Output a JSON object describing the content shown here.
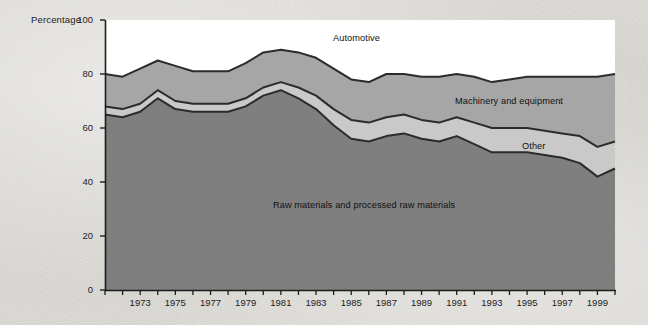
{
  "figure": {
    "background_color": "#d8d6d2",
    "plot_background": "#ffffff"
  },
  "axes": {
    "y_axis_title": "Percentage",
    "y_ticks": [
      "0",
      "20",
      "40",
      "60",
      "80",
      "100"
    ],
    "x_ticks": [
      "1973",
      "1975",
      "1977",
      "1979",
      "1981",
      "1983",
      "1985",
      "1987",
      "1989",
      "1991",
      "1993",
      "1995",
      "1997",
      "1999"
    ]
  },
  "annotations": {
    "automotive": "Automotive",
    "machinery": "Machinery and equipment",
    "other": "Other",
    "raw_materials": "Raw materials and processed raw materials"
  },
  "chart_data": {
    "type": "area",
    "title": "",
    "xlabel": "",
    "ylabel": "Percentage",
    "ylim": [
      0,
      100
    ],
    "xlim": [
      1971,
      2000
    ],
    "grid": false,
    "legend": "inline-annotations",
    "stacked": true,
    "x": [
      1971,
      1972,
      1973,
      1974,
      1975,
      1976,
      1977,
      1978,
      1979,
      1980,
      1981,
      1982,
      1983,
      1984,
      1985,
      1986,
      1987,
      1988,
      1989,
      1990,
      1991,
      1992,
      1993,
      1994,
      1995,
      1996,
      1997,
      1998,
      1999,
      2000
    ],
    "series": [
      {
        "name": "Raw materials and processed raw materials",
        "color": "#7f7f7f",
        "values": [
          65,
          64,
          66,
          71,
          67,
          66,
          66,
          66,
          68,
          72,
          74,
          71,
          67,
          61,
          56,
          55,
          57,
          58,
          56,
          55,
          57,
          54,
          51,
          51,
          51,
          50,
          49,
          47,
          42,
          45
        ]
      },
      {
        "name": "Other",
        "color": "#c9c9c9",
        "values": [
          3,
          3,
          3,
          3,
          3,
          3,
          3,
          3,
          3,
          3,
          3,
          4,
          5,
          6,
          7,
          7,
          7,
          7,
          7,
          7,
          7,
          8,
          9,
          9,
          9,
          9,
          9,
          10,
          11,
          10
        ]
      },
      {
        "name": "Machinery and equipment",
        "color": "#a6a6a6",
        "values": [
          12,
          12,
          13,
          11,
          13,
          12,
          12,
          12,
          13,
          13,
          12,
          13,
          14,
          15,
          15,
          15,
          16,
          15,
          16,
          17,
          16,
          17,
          17,
          18,
          19,
          20,
          21,
          22,
          26,
          25
        ]
      },
      {
        "name": "Automotive",
        "color": "#ffffff",
        "values": [
          20,
          21,
          18,
          15,
          17,
          19,
          19,
          19,
          16,
          12,
          11,
          12,
          14,
          18,
          22,
          23,
          20,
          20,
          21,
          21,
          20,
          21,
          23,
          22,
          21,
          21,
          21,
          21,
          21,
          20
        ]
      }
    ],
    "cumulative_top_boundaries": {
      "raw_materials_top": [
        65,
        64,
        66,
        71,
        67,
        66,
        66,
        66,
        68,
        72,
        74,
        71,
        67,
        61,
        56,
        55,
        57,
        58,
        56,
        55,
        57,
        54,
        51,
        51,
        51,
        50,
        49,
        47,
        42,
        45
      ],
      "other_top": [
        68,
        67,
        69,
        74,
        70,
        69,
        69,
        69,
        71,
        75,
        77,
        75,
        72,
        67,
        63,
        62,
        64,
        65,
        63,
        62,
        64,
        62,
        60,
        60,
        60,
        59,
        58,
        57,
        53,
        55
      ],
      "machinery_top": [
        80,
        79,
        82,
        85,
        83,
        81,
        81,
        81,
        84,
        88,
        89,
        88,
        86,
        82,
        78,
        77,
        80,
        80,
        79,
        79,
        80,
        79,
        77,
        78,
        79,
        79,
        79,
        79,
        79,
        80
      ]
    }
  }
}
